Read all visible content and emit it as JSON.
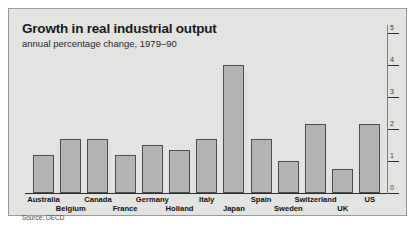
{
  "figure": {
    "title": "Growth in real industrial output",
    "subtitle": "annual percentage change, 1979–90",
    "source": "Source: OECD",
    "panel_color": "#e3e3e1",
    "bar_fill": "#b4b4b2",
    "bar_stroke": "#4d4d4d",
    "axis_color": "#2b2b2b"
  },
  "chart_data": {
    "type": "bar",
    "title": "Growth in real industrial output",
    "subtitle": "annual percentage change, 1979–90",
    "xlabel": "",
    "ylabel": "",
    "ylim": [
      0,
      5
    ],
    "yticks": [
      0,
      1,
      2,
      3,
      4,
      5
    ],
    "ytick_labels": [
      "0",
      "1",
      "2",
      "3",
      "4",
      "5"
    ],
    "y_axis_position": "right",
    "grid": false,
    "legend": null,
    "source": "Source: OECD",
    "categories": [
      "Australia",
      "Belgium",
      "Canada",
      "France",
      "Germany",
      "Holland",
      "Italy",
      "Japan",
      "Spain",
      "Sweden",
      "Switzerland",
      "UK",
      "US"
    ],
    "values": [
      1.2,
      1.7,
      1.7,
      1.2,
      1.5,
      1.35,
      1.7,
      4.0,
      1.7,
      1.0,
      2.15,
      0.75,
      2.15
    ],
    "label_rows": [
      1,
      2,
      1,
      2,
      1,
      2,
      1,
      2,
      1,
      2,
      1,
      2,
      1
    ]
  }
}
